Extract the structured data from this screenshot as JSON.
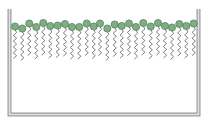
{
  "diagram": {
    "type": "monolayer-at-interface",
    "colors": {
      "background": "#ffffff",
      "container_wall": "#9a9a9a",
      "container_wall_fill": "#e4e4e4",
      "head_fill": "#7fae82",
      "head_stroke": "#4a7a55",
      "tail_stroke": "#6f6f6f"
    },
    "container": {
      "left_x": 9.5,
      "right_x": 198.5,
      "top_y": 9,
      "bottom_y": 114.5,
      "wall_width": 3
    },
    "molecule_count": 26,
    "molecules": [
      {
        "x": 15.0,
        "y": 26.5
      },
      {
        "x": 22.3,
        "y": 28.5
      },
      {
        "x": 29.3,
        "y": 23.5
      },
      {
        "x": 36.3,
        "y": 27.0
      },
      {
        "x": 43.3,
        "y": 23.0
      },
      {
        "x": 50.3,
        "y": 26.0
      },
      {
        "x": 57.7,
        "y": 25.5
      },
      {
        "x": 65.0,
        "y": 24.0
      },
      {
        "x": 72.0,
        "y": 27.0
      },
      {
        "x": 79.3,
        "y": 27.0
      },
      {
        "x": 86.7,
        "y": 23.5
      },
      {
        "x": 93.7,
        "y": 26.5
      },
      {
        "x": 100.0,
        "y": 23.5
      },
      {
        "x": 107.3,
        "y": 28.5
      },
      {
        "x": 114.7,
        "y": 24.5
      },
      {
        "x": 121.7,
        "y": 26.0
      },
      {
        "x": 129.0,
        "y": 23.5
      },
      {
        "x": 136.0,
        "y": 27.0
      },
      {
        "x": 143.3,
        "y": 23.0
      },
      {
        "x": 150.7,
        "y": 26.5
      },
      {
        "x": 158.0,
        "y": 23.0
      },
      {
        "x": 165.0,
        "y": 26.0
      },
      {
        "x": 172.0,
        "y": 27.5
      },
      {
        "x": 179.3,
        "y": 24.0
      },
      {
        "x": 186.3,
        "y": 26.0
      },
      {
        "x": 193.7,
        "y": 23.5
      }
    ],
    "head_radius": 3.6,
    "tail_length": 29,
    "tail_zig_count": 10,
    "tail_amplitude": 1.6
  }
}
